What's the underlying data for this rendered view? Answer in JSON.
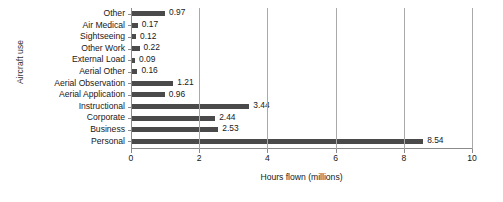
{
  "chart_data": {
    "type": "bar",
    "orientation": "horizontal",
    "title": "",
    "xlabel": "Hours flown (millions)",
    "ylabel": "Aircraft use",
    "categories": [
      "Other",
      "Air Medical",
      "Sightseeing",
      "Other Work",
      "External Load",
      "Aerial Other",
      "Aerial Observation",
      "Aerial Application",
      "Instructional",
      "Corporate",
      "Business",
      "Personal"
    ],
    "values": [
      0.97,
      0.17,
      0.12,
      0.22,
      0.09,
      0.16,
      1.21,
      0.96,
      3.44,
      2.44,
      2.53,
      8.54
    ],
    "data_labels": [
      "0.97",
      "0.17",
      "0.12",
      "0.22",
      "0.09",
      "0.16",
      "1.21",
      "0.96",
      "3.44",
      "2.44",
      "2.53",
      "8.54"
    ],
    "xlim": [
      0,
      10
    ],
    "xticks": [
      0,
      2,
      4,
      6,
      8,
      10
    ],
    "xtick_labels": [
      "0",
      "2",
      "4",
      "6",
      "8",
      "10"
    ],
    "grid": "vertical",
    "legend": "none",
    "bar_color": "#4a4a4a",
    "gridline_color": "#a9a9a9",
    "axis_color": "#8a8a8a"
  }
}
